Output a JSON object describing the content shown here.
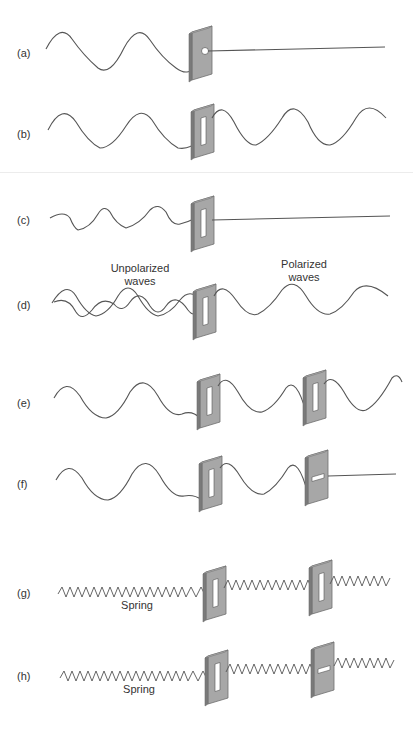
{
  "figure": {
    "colors": {
      "wave": "#555555",
      "barrier_face": "#a7a7a7",
      "barrier_edge": "#6e6e6e",
      "slit": "#ffffff",
      "text": "#333333"
    },
    "rows": [
      {
        "id": "a",
        "label": "(a)",
        "slit": "hole",
        "description": "Wave blocked by barrier with small hole; straight line beyond"
      },
      {
        "id": "b",
        "label": "(b)",
        "slit": "vertical",
        "description": "Vertical wave passes through vertical slit"
      },
      {
        "id": "c",
        "label": "(c)",
        "slit": "vertical",
        "description": "Horizontal wave blocked by vertical slit"
      },
      {
        "id": "d",
        "label": "(d)",
        "slit": "vertical",
        "description": "Unpolarized waves become polarized"
      },
      {
        "id": "e",
        "label": "(e)",
        "slit": "vertical+vertical",
        "description": "Wave passes through two parallel slits"
      },
      {
        "id": "f",
        "label": "(f)",
        "slit": "vertical+horizontal",
        "description": "Wave blocked by crossed slits"
      },
      {
        "id": "g",
        "label": "(g)",
        "slit": "vertical+vertical",
        "description": "Spring passes through two parallel slits"
      },
      {
        "id": "h",
        "label": "(h)",
        "slit": "vertical+horizontal",
        "description": "Spring blocked by crossed slit"
      }
    ],
    "captions": {
      "unpolarized": [
        "Unpolarized",
        "waves"
      ],
      "polarized": [
        "Polarized",
        "waves"
      ],
      "spring_g": "Spring",
      "spring_h": "Spring"
    }
  }
}
